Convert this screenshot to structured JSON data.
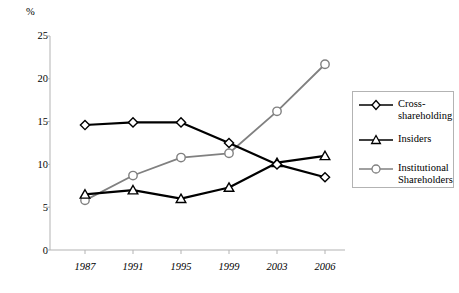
{
  "chart_data": {
    "type": "line",
    "title": "",
    "xlabel": "",
    "ylabel": "%",
    "categories": [
      "1987",
      "1991",
      "1995",
      "1999",
      "2003",
      "2006"
    ],
    "ylim": [
      0,
      25
    ],
    "yticks": [
      0,
      5,
      10,
      15,
      20,
      25
    ],
    "grid": false,
    "legend_position": "right",
    "series": [
      {
        "name": "Cross-shareholding",
        "marker": "diamond",
        "color": "#000000",
        "values": [
          14.6,
          14.9,
          14.9,
          12.5,
          10.0,
          8.5
        ]
      },
      {
        "name": "Insiders",
        "marker": "triangle",
        "color": "#000000",
        "values": [
          6.5,
          7.0,
          6.0,
          7.3,
          10.2,
          11.0
        ]
      },
      {
        "name": "Institutional Shareholders",
        "marker": "circle",
        "color": "#808080",
        "values": [
          5.8,
          8.7,
          10.8,
          11.3,
          16.2,
          21.7
        ]
      }
    ]
  },
  "axis": {
    "unit_label": "%",
    "y_tick_labels": [
      "25",
      "20",
      "15",
      "10",
      "5",
      "0"
    ],
    "x_tick_labels": [
      "1987",
      "1991",
      "1995",
      "1999",
      "2003",
      "2006"
    ]
  },
  "legend": {
    "items": [
      {
        "label": "Cross-\nshareholding",
        "marker": "diamond",
        "color": "#000000"
      },
      {
        "label": "Insiders",
        "marker": "triangle",
        "color": "#000000"
      },
      {
        "label": "Institutional\nShareholders",
        "marker": "circle",
        "color": "#808080"
      }
    ]
  },
  "colors": {
    "axis": "#b3b3b3",
    "series_dark": "#000000",
    "series_grey": "#808080",
    "background": "#ffffff"
  }
}
